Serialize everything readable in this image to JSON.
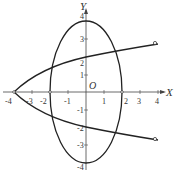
{
  "diagram": {
    "type": "coordinate-plot",
    "origin_label": "O",
    "x_axis": {
      "name": "X",
      "tick_values": [
        -4,
        -3,
        -2,
        -1,
        1,
        2,
        3,
        4
      ],
      "tick_labels": [
        "-4",
        "-3",
        "-2",
        "-1",
        "1",
        "2",
        "3",
        "4"
      ]
    },
    "y_axis": {
      "name": "Y",
      "tick_values": [
        4,
        3,
        2,
        1,
        -1,
        -2,
        -3,
        -4
      ],
      "tick_labels": [
        "4",
        "3",
        "2",
        "1",
        "-1",
        "-2",
        "-3",
        "-4"
      ]
    },
    "curves": [
      {
        "name": "ellipse",
        "equation": "x^2/4 + y^2/16 = 1",
        "center": [
          0,
          0
        ],
        "rx": 2,
        "ry": 4
      },
      {
        "name": "parabola",
        "equation": "y^2 = 2(x + 4)",
        "vertex": [
          -4,
          0
        ],
        "opens": "right",
        "open_endpoints": [
          [
            4,
            3
          ],
          [
            4,
            -3
          ]
        ]
      }
    ],
    "colors": {
      "stroke": "#222222",
      "text": "#333333",
      "background": "#ffffff"
    }
  }
}
